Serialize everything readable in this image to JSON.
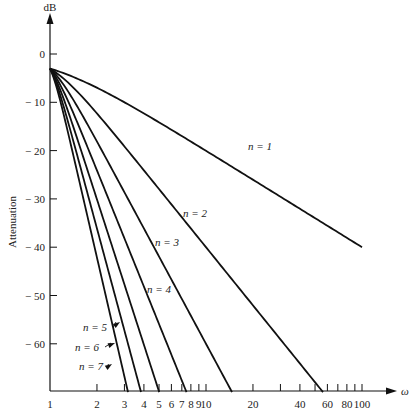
{
  "chart_data": {
    "type": "line",
    "title": "",
    "xlabel": "ω",
    "ylabel": "Attenuation",
    "yunit": "dB",
    "xscale": "log",
    "xlim": [
      1,
      100
    ],
    "ylim": [
      -70,
      0
    ],
    "grid": false,
    "legend": "inline labels",
    "x_ticks": [
      1,
      2,
      3,
      4,
      5,
      6,
      7,
      8,
      9,
      10,
      20,
      30,
      40,
      50,
      60,
      70,
      80,
      90,
      100
    ],
    "x_tick_labels": [
      {
        "v": 1,
        "t": "1"
      },
      {
        "v": 2,
        "t": "2"
      },
      {
        "v": 3,
        "t": "3"
      },
      {
        "v": 4,
        "t": "4"
      },
      {
        "v": 5,
        "t": "5"
      },
      {
        "v": 6,
        "t": "6"
      },
      {
        "v": 7,
        "t": "7"
      },
      {
        "v": 8,
        "t": "8"
      },
      {
        "v": 9,
        "t": "9"
      },
      {
        "v": 10,
        "t": "10"
      },
      {
        "v": 20,
        "t": "20"
      },
      {
        "v": 40,
        "t": "40"
      },
      {
        "v": 60,
        "t": "60"
      },
      {
        "v": 80,
        "t": "80"
      },
      {
        "v": 100,
        "t": "100"
      }
    ],
    "y_ticks": [
      {
        "v": 0,
        "t": "0"
      },
      {
        "v": -10,
        "t": "− 10"
      },
      {
        "v": -20,
        "t": "− 20"
      },
      {
        "v": -30,
        "t": "− 30"
      },
      {
        "v": -40,
        "t": "− 40"
      },
      {
        "v": -50,
        "t": "− 50"
      },
      {
        "v": -60,
        "t": "− 60"
      }
    ],
    "formula": "A(ω) = -10·log10(1 + ω^(2n))",
    "series": [
      {
        "name": "n = 1",
        "n": 1,
        "x": [
          1,
          2,
          5,
          10,
          20,
          50,
          100
        ],
        "values": [
          -3.0,
          -7.0,
          -14.1,
          -20.0,
          -26.0,
          -34.0,
          -40.0
        ],
        "label_pos": [
          248,
          150
        ]
      },
      {
        "name": "n = 2",
        "n": 2,
        "x": [
          1,
          2,
          5,
          10,
          20,
          40,
          56
        ],
        "values": [
          -3.0,
          -12.3,
          -28.0,
          -40.0,
          -52.0,
          -64.1,
          -70.0
        ],
        "label_pos": [
          183,
          217
        ]
      },
      {
        "name": "n = 3",
        "n": 3,
        "x": [
          1,
          2,
          4,
          8,
          10,
          14.7
        ],
        "values": [
          -3.0,
          -18.1,
          -36.1,
          -54.2,
          -60.0,
          -70.0
        ],
        "label_pos": [
          155,
          246
        ]
      },
      {
        "name": "n = 4",
        "n": 4,
        "x": [
          1,
          2,
          4,
          6,
          7.5
        ],
        "values": [
          -3.0,
          -24.1,
          -48.2,
          -62.3,
          -70.0
        ],
        "label_pos": [
          147,
          293
        ]
      },
      {
        "name": "n = 5",
        "n": 5,
        "x": [
          1,
          2,
          4,
          5.0
        ],
        "values": [
          -3.0,
          -30.1,
          -60.2,
          -70.0
        ],
        "label_pos": [
          83,
          331
        ],
        "arrow_to": [
          120,
          322
        ]
      },
      {
        "name": "n = 6",
        "n": 6,
        "x": [
          1,
          2,
          3,
          3.8
        ],
        "values": [
          -3.0,
          -36.1,
          -57.3,
          -70.0
        ],
        "label_pos": [
          75,
          351
        ],
        "arrow_to": [
          115,
          343
        ]
      },
      {
        "name": "n = 7",
        "n": 7,
        "x": [
          1,
          2,
          3,
          3.16
        ],
        "values": [
          -3.0,
          -42.1,
          -66.8,
          -70.0
        ],
        "label_pos": [
          79,
          370
        ],
        "arrow_to": [
          112,
          364
        ]
      }
    ]
  }
}
